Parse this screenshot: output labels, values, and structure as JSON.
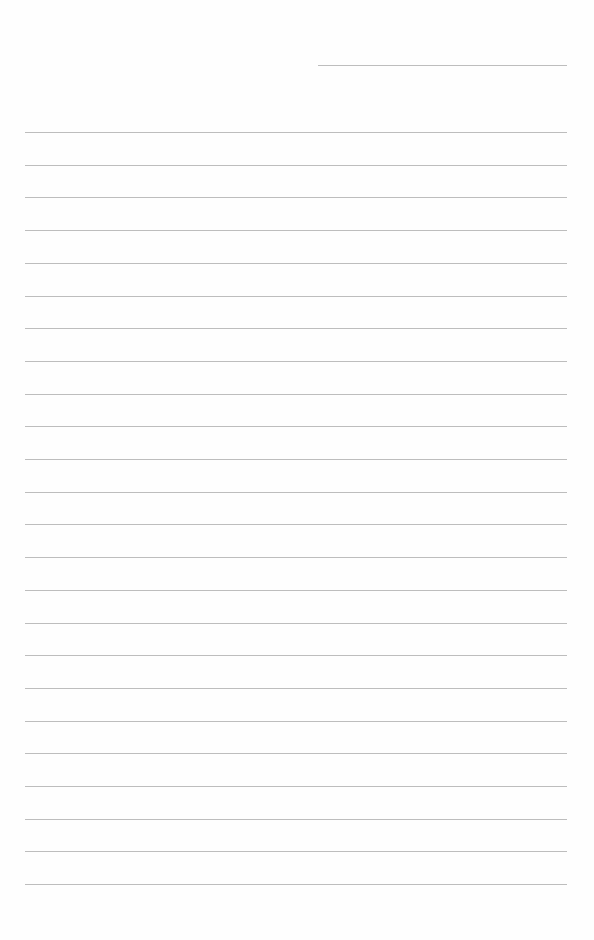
{
  "page": {
    "type": "lined-paper",
    "header_line": {
      "x": 318,
      "y": 65,
      "width": 249
    },
    "rule_lines": {
      "count": 24,
      "x": 25,
      "width": 542,
      "first_y": 132,
      "spacing": 32.7,
      "color": "#bdbdbd"
    }
  }
}
